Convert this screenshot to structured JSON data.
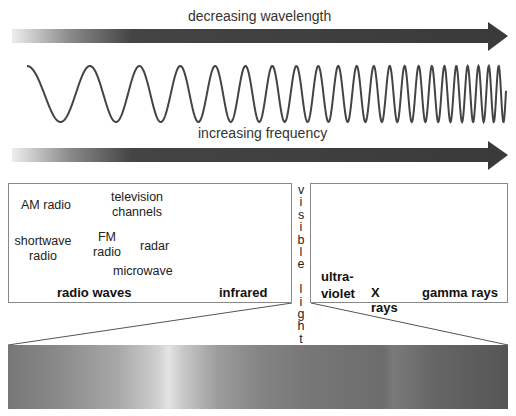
{
  "top_arrow": {
    "label": "decreasing wavelength"
  },
  "bottom_arrow": {
    "label": "increasing frequency"
  },
  "regions": [
    {
      "name": "radio waves",
      "examples": [
        "AM radio",
        "television channels",
        "shortwave radio",
        "FM radio",
        "radar",
        "microwave"
      ]
    },
    {
      "name": "infrared"
    },
    {
      "name": "visible light"
    },
    {
      "name": "ultra-violet"
    },
    {
      "name": "X rays"
    },
    {
      "name": "gamma rays"
    }
  ],
  "radio": {
    "title": "radio waves",
    "am": "AM radio",
    "tv1": "television",
    "tv2": "channels",
    "sw1": "shortwave",
    "sw2": "radio",
    "fm1": "FM",
    "fm2": "radio",
    "radar": "radar",
    "microwave": "microwave"
  },
  "infrared": {
    "title": "infrared"
  },
  "visible": {
    "letters": [
      "v",
      "i",
      "s",
      "i",
      "b",
      "l",
      "e",
      "",
      "l",
      "i",
      "g",
      "h",
      "t"
    ]
  },
  "uv": {
    "line1": "ultra-",
    "line2": "violet"
  },
  "xrays": {
    "title": "X rays"
  },
  "gamma": {
    "title": "gamma rays"
  },
  "colors": {
    "arrow_dark": "#3a3a3a",
    "wave": "#444444",
    "border": "#888888"
  }
}
